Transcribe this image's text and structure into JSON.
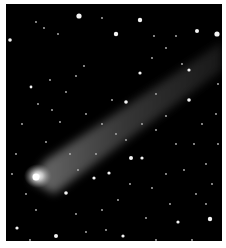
{
  "image": {
    "subject": "comet with long tail against starfield",
    "background_color": "#000000",
    "border_color": "#ffffff",
    "comet": {
      "head": {
        "x": 32,
        "y": 172,
        "color": "#f2f2f2"
      },
      "tail_end": {
        "x": 216,
        "y": 48
      },
      "tail_color": "#bdbdbd"
    },
    "bright_stars": [
      {
        "x": 73,
        "y": 12,
        "r": 2.6
      },
      {
        "x": 110,
        "y": 30,
        "r": 2.2
      },
      {
        "x": 134,
        "y": 16,
        "r": 2.2
      },
      {
        "x": 211,
        "y": 30,
        "r": 2.6
      },
      {
        "x": 191,
        "y": 27,
        "r": 2
      },
      {
        "x": 4,
        "y": 36,
        "r": 1.8
      },
      {
        "x": 134,
        "y": 69,
        "r": 1.6
      },
      {
        "x": 183,
        "y": 66,
        "r": 1.6
      },
      {
        "x": 120,
        "y": 98,
        "r": 1.8
      },
      {
        "x": 183,
        "y": 96,
        "r": 1.8
      },
      {
        "x": 125,
        "y": 154,
        "r": 2
      },
      {
        "x": 136,
        "y": 154,
        "r": 1.6
      },
      {
        "x": 204,
        "y": 215,
        "r": 2.2
      },
      {
        "x": 50,
        "y": 232,
        "r": 2
      },
      {
        "x": 11,
        "y": 224,
        "r": 1.6
      },
      {
        "x": 60,
        "y": 189,
        "r": 1.8
      },
      {
        "x": 103,
        "y": 169,
        "r": 1.6
      },
      {
        "x": 172,
        "y": 218,
        "r": 1.6
      },
      {
        "x": 25,
        "y": 83,
        "r": 1.4
      },
      {
        "x": 117,
        "y": 232,
        "r": 1.6
      },
      {
        "x": 88,
        "y": 174,
        "r": 1.6
      }
    ],
    "faint_stars": [
      [
        30,
        18
      ],
      [
        38,
        24
      ],
      [
        52,
        30
      ],
      [
        96,
        14
      ],
      [
        148,
        32
      ],
      [
        160,
        44
      ],
      [
        170,
        32
      ],
      [
        176,
        60
      ],
      [
        146,
        54
      ],
      [
        78,
        62
      ],
      [
        70,
        72
      ],
      [
        44,
        76
      ],
      [
        60,
        88
      ],
      [
        32,
        100
      ],
      [
        46,
        106
      ],
      [
        54,
        118
      ],
      [
        40,
        138
      ],
      [
        80,
        110
      ],
      [
        96,
        120
      ],
      [
        106,
        96
      ],
      [
        150,
        90
      ],
      [
        160,
        112
      ],
      [
        196,
        120
      ],
      [
        188,
        140
      ],
      [
        170,
        140
      ],
      [
        150,
        126
      ],
      [
        200,
        160
      ],
      [
        178,
        166
      ],
      [
        160,
        170
      ],
      [
        146,
        184
      ],
      [
        190,
        190
      ],
      [
        112,
        196
      ],
      [
        96,
        206
      ],
      [
        70,
        210
      ],
      [
        30,
        206
      ],
      [
        20,
        190
      ],
      [
        10,
        150
      ],
      [
        16,
        120
      ],
      [
        120,
        136
      ],
      [
        136,
        120
      ],
      [
        210,
        110
      ],
      [
        212,
        80
      ],
      [
        206,
        180
      ],
      [
        164,
        200
      ],
      [
        140,
        214
      ],
      [
        100,
        226
      ],
      [
        80,
        228
      ],
      [
        24,
        236
      ],
      [
        186,
        236
      ],
      [
        150,
        236
      ],
      [
        6,
        170
      ],
      [
        64,
        150
      ],
      [
        72,
        166
      ],
      [
        90,
        150
      ],
      [
        110,
        130
      ],
      [
        124,
        180
      ],
      [
        200,
        200
      ],
      [
        212,
        140
      ]
    ]
  }
}
